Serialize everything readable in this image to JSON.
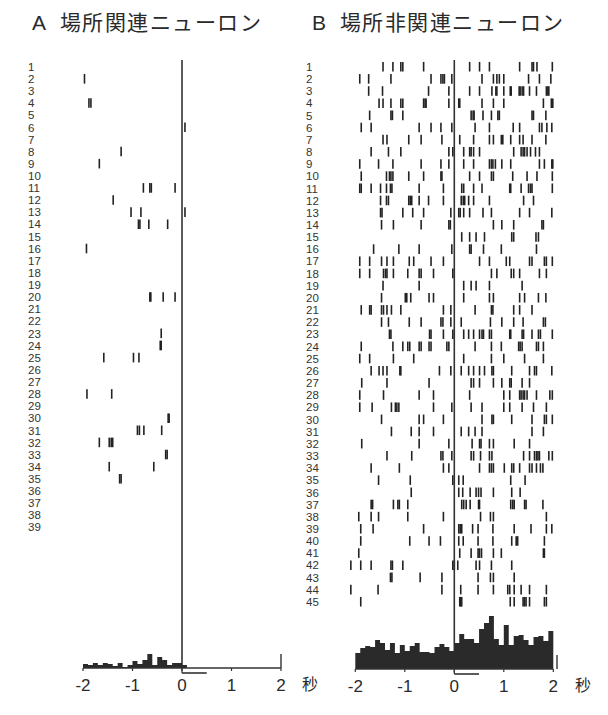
{
  "titles": {
    "a_letter": "A",
    "a_text": "場所関連ニューロン",
    "b_letter": "B",
    "b_text": "場所非関連ニューロン"
  },
  "colors": {
    "spike": "#222222",
    "histogram": "#2a2a2a",
    "axis": "#333333"
  },
  "chart_data": [
    {
      "id": "A",
      "type": "scatter",
      "subtype": "spike-raster-with-psth",
      "title": "場所関連ニューロン",
      "xlabel": "秒",
      "ylabel": "",
      "xlim": [
        -2,
        2
      ],
      "x_ticks": [
        -2,
        -1,
        0,
        1,
        2
      ],
      "x_tick_labels": [
        "-2",
        "-1",
        "0",
        "1",
        "2"
      ],
      "event_line_x": 0,
      "stimulus_bar": [
        0,
        0.5
      ],
      "grid": false,
      "n_trials": 39,
      "trials": [
        [],
        [
          -1.97
        ],
        [],
        [
          -1.88,
          -1.84
        ],
        [],
        [
          0.06
        ],
        [],
        [
          -1.23
        ],
        [
          -1.67
        ],
        [],
        [
          -0.78,
          -0.65,
          -0.62,
          -0.14
        ],
        [
          -1.39
        ],
        [
          -1.03,
          -0.83,
          0.06
        ],
        [
          -0.88,
          -0.85,
          -0.67,
          -0.29
        ],
        [],
        [
          -1.93
        ],
        [],
        [],
        [],
        [
          -0.65,
          -0.63,
          -0.38,
          -0.14
        ],
        [],
        [],
        [
          -0.42
        ],
        [
          -0.44,
          -0.42
        ],
        [
          -1.58,
          -0.98,
          -0.87
        ],
        [],
        [],
        [
          -1.92,
          -1.42
        ],
        [],
        [
          -0.28,
          -0.26
        ],
        [
          -0.9,
          -0.86,
          -0.77,
          -0.41
        ],
        [
          -1.67,
          -1.47,
          -1.43,
          -1.4
        ],
        [
          -0.33,
          -0.3
        ],
        [
          -1.47,
          -0.57
        ],
        [
          -1.26,
          -1.23
        ],
        [],
        [],
        [],
        []
      ],
      "histogram": {
        "type": "bar",
        "bin_start": -2,
        "bin_width": 0.1,
        "values": [
          4,
          3,
          5,
          3,
          5,
          4,
          2,
          5,
          1,
          3,
          7,
          4,
          8,
          14,
          3,
          11,
          8,
          3,
          5,
          5,
          3,
          0,
          0,
          0,
          0,
          0,
          0,
          0,
          0,
          0,
          0,
          0,
          0,
          0,
          0,
          0,
          0,
          0,
          0,
          0
        ]
      }
    },
    {
      "id": "B",
      "type": "scatter",
      "subtype": "spike-raster-with-psth",
      "title": "場所非関連ニューロン",
      "xlabel": "秒",
      "ylabel": "",
      "xlim": [
        -2,
        2
      ],
      "x_ticks": [
        -2,
        -1,
        0,
        1,
        2
      ],
      "x_tick_labels": [
        "-2",
        "-1",
        "0",
        "1",
        "2"
      ],
      "event_line_x": 0,
      "stimulus_bar": [
        0,
        0.5
      ],
      "grid": false,
      "n_trials": 45,
      "trials": [
        [
          -1.44,
          -1.24,
          -1.08,
          -1.04,
          -0.62,
          0.31,
          0.51,
          0.71,
          1.32,
          1.57,
          1.6,
          1.67,
          1.98
        ],
        [
          -1.91,
          -1.73,
          -1.28,
          -0.47,
          -0.27,
          -0.23,
          -0.2,
          -0.05,
          0.56,
          0.79,
          0.86,
          0.91,
          1.0,
          1.5,
          1.72,
          1.95
        ],
        [
          -1.73,
          -1.45,
          -0.52,
          -0.11,
          0.31,
          0.51,
          0.76,
          0.84,
          0.86,
          1.0,
          1.13,
          1.15,
          1.31,
          1.33,
          1.37,
          1.4,
          1.52,
          1.66,
          1.86,
          1.89,
          1.91
        ],
        [
          -1.52,
          -1.44,
          -1.28,
          -1.08,
          -1.04,
          -0.62,
          -0.59,
          -0.57,
          -0.11,
          0.09,
          0.11,
          0.56,
          0.79,
          1.0,
          1.8,
          1.96,
          1.99
        ],
        [
          -1.71,
          -1.28,
          -1.25,
          -1.04,
          0.34,
          0.38,
          0.4,
          0.58,
          0.75,
          0.88,
          0.91,
          1.57,
          1.6,
          1.85
        ],
        [
          -1.88,
          -1.68,
          -0.71,
          -0.47,
          -0.27,
          -0.05,
          0.42,
          0.71,
          1.19,
          1.32,
          1.72,
          1.77,
          1.87,
          1.97
        ],
        [
          -1.44,
          -1.36,
          -0.92,
          -0.67,
          -0.25,
          0.11,
          0.39,
          0.71,
          0.79,
          0.95,
          0.98,
          1.14,
          1.32,
          1.39,
          1.57,
          1.85
        ],
        [
          -1.68,
          -1.33,
          -1.08,
          -0.11,
          -0.03,
          0.19,
          0.31,
          0.34,
          0.39,
          0.51,
          1.2,
          1.35,
          1.39,
          1.42,
          1.47,
          1.54,
          1.64,
          1.72
        ],
        [
          -1.91,
          -1.53,
          -1.24,
          -0.67,
          -0.27,
          -0.11,
          0.19,
          0.39,
          0.71,
          0.75,
          0.78,
          0.83,
          0.96,
          1.14,
          1.72,
          1.82,
          1.97,
          1.99
        ],
        [
          -1.88,
          -1.37,
          -1.31,
          -1.28,
          -1.24,
          -0.92,
          -0.62,
          -0.27,
          -0.25,
          0.31,
          0.51,
          0.75,
          0.79,
          1.18,
          1.47,
          1.67,
          1.98
        ],
        [
          -1.91,
          -1.88,
          -1.68,
          -1.49,
          -1.37,
          -1.29,
          -1.26,
          -0.71,
          -0.22,
          0.15,
          0.19,
          0.39,
          0.56,
          1.12,
          1.14,
          1.35,
          1.5,
          1.54,
          1.57,
          1.98
        ],
        [
          -1.49,
          -1.37,
          -1.33,
          -0.92,
          -0.89,
          -0.86,
          -0.71,
          -0.52,
          -0.22,
          0.14,
          0.18,
          0.21,
          0.29,
          0.39,
          0.71,
          1.4,
          1.6
        ],
        [
          -1.49,
          -1.46,
          -1.04,
          -0.84,
          -0.62,
          -0.07,
          0.09,
          0.12,
          0.19,
          0.31,
          0.58,
          0.75,
          1.32,
          1.52,
          1.97
        ],
        [
          -1.47,
          -1.23,
          -0.67,
          -0.11,
          -0.08,
          0.79,
          0.96,
          1.2,
          1.77,
          1.8
        ],
        [
          0.15,
          0.31,
          0.44,
          0.61,
          1.16,
          1.2,
          1.65,
          1.7
        ],
        [
          -1.63,
          -1.12,
          -0.71,
          -0.05,
          0.31,
          0.34,
          0.59,
          0.95,
          1.66
        ],
        [
          -1.91,
          -1.71,
          -1.47,
          -1.36,
          -1.23,
          -0.91,
          -0.82,
          -0.47,
          -0.22,
          0.51,
          0.71,
          1.05,
          1.12,
          1.52,
          1.57,
          1.82,
          1.86,
          1.98
        ],
        [
          -1.91,
          -1.71,
          -1.43,
          -1.39,
          -1.36,
          -1.23,
          -0.94,
          -0.71,
          -0.67,
          -0.42,
          -0.03,
          0.75,
          0.86,
          1.15,
          1.2,
          1.32,
          1.72,
          1.86
        ],
        [
          -1.44,
          -0.71,
          0.19,
          0.34,
          0.44,
          0.71,
          1.37
        ],
        [
          -1.47,
          -0.99,
          -0.96,
          -0.88,
          -0.51,
          -0.42,
          0.19,
          0.71,
          0.79,
          1.32,
          1.42,
          1.7,
          1.85
        ],
        [
          -1.88,
          -1.71,
          -1.68,
          -1.47,
          -1.43,
          -1.36,
          -1.27,
          -1.08,
          -0.22,
          -0.07,
          0.42,
          0.75,
          0.78,
          1.2,
          1.32,
          1.57
        ],
        [
          -1.47,
          -1.33,
          -0.91,
          -0.67,
          -0.27,
          -0.23,
          -0.07,
          0.14,
          0.73,
          0.96,
          1.2,
          1.39,
          1.8,
          1.84
        ],
        [
          -1.31,
          -1.28,
          -0.5,
          -0.47,
          -0.22,
          -0.03,
          0.19,
          0.29,
          0.39,
          0.51,
          0.56,
          0.59,
          0.71,
          0.75,
          1.12,
          1.14,
          1.37,
          1.4,
          1.57,
          1.7,
          1.74,
          1.98
        ],
        [
          -1.88,
          -1.24,
          -1.04,
          -0.94,
          -0.9,
          -0.71,
          -0.67,
          -0.51,
          -0.47,
          -0.15,
          -0.11,
          0.42,
          0.75,
          0.95,
          1.3,
          1.33,
          1.37,
          1.66,
          1.7,
          1.8
        ],
        [
          -1.91,
          -1.71,
          -1.23,
          -0.82,
          0.19,
          0.75,
          1.0,
          1.42,
          1.8
        ],
        [
          -1.68,
          -1.52,
          -1.44,
          -1.36,
          -1.1,
          -1.08,
          -0.3,
          -0.07,
          0.14,
          0.29,
          0.39,
          0.51,
          0.61,
          0.76,
          0.79,
          1.16,
          1.52,
          1.62,
          1.66,
          1.97
        ],
        [
          -1.87,
          -1.36,
          -0.51,
          0.34,
          0.39,
          0.51,
          0.79,
          0.96,
          1.12,
          1.15,
          1.37,
          1.52
        ],
        [
          -1.91,
          -1.43,
          -0.71,
          -0.42,
          0.31,
          1.0,
          1.12,
          1.32,
          1.35,
          1.39,
          1.42,
          1.47,
          1.66,
          1.93,
          1.98
        ],
        [
          -1.91,
          -1.66,
          -1.27,
          -1.19,
          -1.16,
          -1.12,
          -0.42,
          -0.05,
          0.34,
          0.56,
          1.0,
          1.12,
          1.37,
          1.6,
          1.86
        ],
        [
          -1.47,
          -0.71,
          -0.62,
          -0.22,
          0.56,
          0.76,
          0.79,
          1.16,
          1.57,
          1.82,
          1.86,
          1.98
        ],
        [
          -1.27,
          -0.87,
          -0.71,
          -0.42,
          0.14,
          0.29,
          0.42,
          0.56,
          1.57,
          1.8
        ],
        [
          -1.87,
          -0.71,
          -0.11,
          0.36,
          0.51,
          0.54,
          0.71,
          0.79,
          1.21,
          1.52
        ],
        [
          -1.36,
          -0.86,
          -0.27,
          -0.23,
          -0.05,
          0.34,
          0.39,
          0.53,
          0.71,
          0.76,
          1.4,
          1.52,
          1.62,
          1.66,
          1.69,
          1.72,
          1.91,
          1.98
        ],
        [
          -1.68,
          -1.11,
          -0.22,
          -0.11,
          0.51,
          0.71,
          0.75,
          0.79,
          1.01,
          1.16,
          1.2,
          1.32,
          1.52,
          1.57,
          1.66,
          1.74,
          1.79
        ],
        [
          -1.53,
          -0.89,
          -0.03,
          0.09,
          0.18,
          1.14,
          1.43
        ],
        [
          -0.87,
          0.09,
          0.17,
          0.32,
          0.44,
          0.49,
          0.54,
          0.79,
          1.16,
          1.33
        ],
        [
          -1.68,
          -1.65,
          -1.23,
          -1.14,
          -1.11,
          -0.94,
          0.15,
          0.19,
          0.24,
          0.32,
          0.49,
          0.51,
          1.14,
          1.18,
          1.21,
          1.42,
          1.45,
          1.79
        ],
        [
          -1.93,
          -1.68,
          -1.53,
          -0.94,
          -0.22,
          0.53,
          0.73,
          0.79,
          1.86
        ],
        [
          -1.89,
          -1.64,
          -0.62,
          0.09,
          0.12,
          0.15,
          0.37,
          0.48,
          0.78,
          1.21,
          1.55,
          1.86,
          1.97
        ],
        [
          -1.89,
          -0.9,
          -0.51,
          -0.28,
          0.09,
          0.18,
          0.48,
          0.78,
          1.16,
          1.25,
          1.28,
          1.82
        ],
        [
          -1.93,
          0.11,
          0.34,
          0.48,
          0.51,
          0.55,
          0.79,
          0.95,
          1.8,
          1.82
        ],
        [
          -2.09,
          -1.89,
          -1.68,
          -1.28,
          -1.25,
          -1.04,
          -0.03,
          0.0,
          0.07,
          0.44,
          0.51,
          0.75,
          1.16
        ],
        [
          -1.29,
          -1.26,
          -0.69,
          -0.25,
          0.48,
          0.73,
          0.79,
          1.21
        ],
        [
          -2.09,
          -1.54,
          -0.25,
          0.13,
          0.48,
          0.79,
          1.08,
          1.12,
          1.21,
          1.35,
          1.52,
          1.86
        ],
        [
          -1.89,
          0.11,
          0.13,
          0.15,
          1.13,
          1.21,
          1.39,
          1.42,
          1.45,
          1.52,
          1.82,
          1.86
        ]
      ],
      "histogram": {
        "type": "bar",
        "bin_start": -2,
        "bin_width": 0.1,
        "values": [
          16,
          21,
          23,
          22,
          29,
          26,
          19,
          26,
          16,
          24,
          18,
          23,
          26,
          17,
          17,
          16,
          22,
          25,
          22,
          18,
          26,
          35,
          30,
          30,
          26,
          40,
          46,
          53,
          30,
          24,
          44,
          24,
          33,
          34,
          29,
          24,
          32,
          33,
          28,
          38
        ]
      }
    }
  ]
}
